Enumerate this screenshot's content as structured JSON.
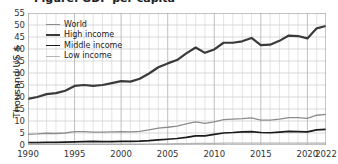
{
  "title_partial": "Figure: GDP per capita",
  "axes": {
    "ylabel": "Thousand US $",
    "yticks": [
      0,
      5,
      10,
      15,
      20,
      25,
      30,
      35,
      40,
      45,
      50,
      55
    ],
    "xticks": [
      "1990",
      "1995",
      "2000",
      "2005",
      "2010",
      "2015",
      "2020",
      "2022"
    ],
    "xtick_values": [
      1990,
      1995,
      2000,
      2005,
      2010,
      2015,
      2020,
      2022
    ]
  },
  "legend": {
    "items": [
      {
        "label": "World",
        "color": "#8c8c8c",
        "width": 1.3
      },
      {
        "label": "High income",
        "color": "#3a3a3a",
        "width": 2.2
      },
      {
        "label": "Middle income",
        "color": "#1a1a1a",
        "width": 1.7
      },
      {
        "label": "Low income",
        "color": "#b5b5b5",
        "width": 1.2
      }
    ]
  },
  "chart_data": {
    "type": "line",
    "title": "Figure: GDP per capita",
    "xlabel": "",
    "ylabel": "Thousand US $",
    "xlim": [
      1990,
      2022
    ],
    "ylim": [
      0,
      55
    ],
    "grid": true,
    "legend_position": "upper-left-inside",
    "x": [
      1990,
      1991,
      1992,
      1993,
      1994,
      1995,
      1996,
      1997,
      1998,
      1999,
      2000,
      2001,
      2002,
      2003,
      2004,
      2005,
      2006,
      2007,
      2008,
      2009,
      2010,
      2011,
      2012,
      2013,
      2014,
      2015,
      2016,
      2017,
      2018,
      2019,
      2020,
      2021,
      2022
    ],
    "series": [
      {
        "name": "High income",
        "color": "#3a3a3a",
        "values": [
          19.2,
          20.0,
          21.2,
          21.6,
          22.6,
          24.6,
          25.0,
          24.6,
          25.0,
          25.8,
          26.6,
          26.4,
          27.6,
          29.8,
          32.4,
          34.0,
          35.4,
          38.2,
          40.6,
          38.4,
          39.8,
          42.6,
          42.6,
          43.2,
          44.6,
          41.6,
          41.8,
          43.4,
          45.6,
          45.4,
          44.4,
          48.6,
          49.6
        ]
      },
      {
        "name": "World",
        "color": "#8c8c8c",
        "values": [
          4.4,
          4.6,
          4.9,
          4.8,
          5.0,
          5.6,
          5.6,
          5.4,
          5.4,
          5.5,
          5.6,
          5.5,
          5.7,
          6.3,
          7.0,
          7.4,
          7.9,
          8.8,
          9.6,
          9.0,
          9.6,
          10.6,
          10.8,
          11.0,
          11.3,
          10.4,
          10.4,
          10.8,
          11.4,
          11.4,
          11.1,
          12.4,
          12.8
        ]
      },
      {
        "name": "Middle income",
        "color": "#1a1a1a",
        "values": [
          1.0,
          1.0,
          1.1,
          1.1,
          1.2,
          1.3,
          1.4,
          1.5,
          1.4,
          1.4,
          1.5,
          1.5,
          1.6,
          1.8,
          2.1,
          2.4,
          2.7,
          3.2,
          3.8,
          3.8,
          4.4,
          5.0,
          5.2,
          5.5,
          5.6,
          5.2,
          5.1,
          5.4,
          5.7,
          5.6,
          5.5,
          6.3,
          6.5
        ]
      },
      {
        "name": "Low income",
        "color": "#b5b5b5",
        "values": [
          0.4,
          0.38,
          0.36,
          0.34,
          0.33,
          0.36,
          0.37,
          0.38,
          0.38,
          0.38,
          0.38,
          0.38,
          0.39,
          0.42,
          0.46,
          0.5,
          0.55,
          0.6,
          0.66,
          0.66,
          0.7,
          0.74,
          0.78,
          0.8,
          0.82,
          0.78,
          0.76,
          0.78,
          0.8,
          0.8,
          0.78,
          0.8,
          0.82
        ]
      }
    ]
  }
}
